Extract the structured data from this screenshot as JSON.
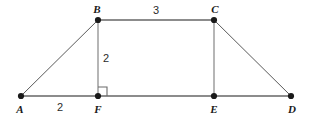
{
  "figure": {
    "width": 311,
    "height": 118,
    "background_color": "#ffffff",
    "thick_stroke_color": "#8c8c8c",
    "thin_stroke_color": "#5a5a5a",
    "vertex_color": "#1a1a1a",
    "label_color": "#1a1a1a",
    "measure_color": "#2b2b2b"
  },
  "vertices": [
    {
      "id": "A",
      "label": "A",
      "x": 21,
      "y": 96,
      "label_x": 20,
      "label_y": 109
    },
    {
      "id": "B",
      "label": "B",
      "x": 98,
      "y": 20,
      "label_x": 97,
      "label_y": 9
    },
    {
      "id": "C",
      "label": "C",
      "x": 214,
      "y": 20,
      "label_x": 215,
      "label_y": 9
    },
    {
      "id": "D",
      "label": "D",
      "x": 291,
      "y": 96,
      "label_x": 292,
      "label_y": 109
    },
    {
      "id": "E",
      "label": "E",
      "x": 214,
      "y": 96,
      "label_x": 214,
      "label_y": 109
    },
    {
      "id": "F",
      "label": "F",
      "x": 98,
      "y": 96,
      "label_x": 98,
      "label_y": 109
    }
  ],
  "segments": [
    {
      "id": "AD",
      "from": "A",
      "to": "D",
      "x1": 21,
      "y1": 96,
      "x2": 291,
      "y2": 96,
      "weight": "thick"
    },
    {
      "id": "BC",
      "from": "B",
      "to": "C",
      "x1": 98,
      "y1": 20,
      "x2": 214,
      "y2": 20,
      "weight": "thick"
    },
    {
      "id": "AB",
      "from": "A",
      "to": "B",
      "x1": 21,
      "y1": 96,
      "x2": 98,
      "y2": 20,
      "weight": "thin"
    },
    {
      "id": "CD",
      "from": "C",
      "to": "D",
      "x1": 214,
      "y1": 20,
      "x2": 291,
      "y2": 96,
      "weight": "thin"
    },
    {
      "id": "BF",
      "from": "B",
      "to": "F",
      "x1": 98,
      "y1": 20,
      "x2": 98,
      "y2": 96,
      "weight": "thin"
    },
    {
      "id": "CE",
      "from": "C",
      "to": "E",
      "x1": 214,
      "y1": 20,
      "x2": 214,
      "y2": 96,
      "weight": "thin"
    }
  ],
  "measurements": [
    {
      "id": "AF",
      "value": "2",
      "segment": "AF",
      "x": 60,
      "y": 107
    },
    {
      "id": "BF",
      "value": "2",
      "segment": "BF",
      "x": 106,
      "y": 58
    },
    {
      "id": "BC",
      "value": "3",
      "segment": "BC",
      "x": 156,
      "y": 10
    }
  ],
  "right_angle": {
    "at_vertex": "F",
    "label": "right-angle-marker",
    "x": 98,
    "y": 96,
    "size": 9,
    "direction": "up-right"
  }
}
